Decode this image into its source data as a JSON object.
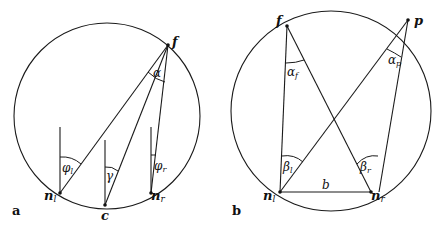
{
  "panels": {
    "a": {
      "panel_label": "a",
      "points": {
        "f": "f",
        "n_l": "n",
        "n_l_sub": "l",
        "c": "c",
        "n_r": "n",
        "n_r_sub": "r"
      },
      "angles": {
        "alpha": "α",
        "phi_l": "φ",
        "phi_l_sub": "l",
        "gamma": "γ",
        "phi_r": "φ",
        "phi_r_sub": "r"
      }
    },
    "b": {
      "panel_label": "b",
      "points": {
        "f": "f",
        "p": "p",
        "n_l": "n",
        "n_l_sub": "l",
        "n_r": "n",
        "n_r_sub": "r"
      },
      "segment_labels": {
        "baseline": "b"
      },
      "angles": {
        "alpha_f": "α",
        "alpha_f_sub": "f",
        "alpha_p": "α",
        "alpha_p_sub": "p",
        "beta_l": "β",
        "beta_l_sub": "l",
        "beta_r": "β",
        "beta_r_sub": "r"
      }
    }
  },
  "colors": {
    "stroke": "#1a1a1a",
    "background": "#ffffff"
  }
}
